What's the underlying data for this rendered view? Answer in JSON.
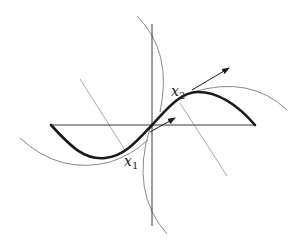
{
  "diagram": {
    "labels": {
      "x1": {
        "base": "x",
        "sub": "1"
      },
      "x2": {
        "base": "x",
        "sub": "2"
      }
    },
    "colors": {
      "curve": "#1a1a1a",
      "axes": "#3a3a3a",
      "circles": "#8a8a8a",
      "normals": "#a0a0a0",
      "arrows": "#1a1a1a",
      "background": "#ffffff"
    }
  }
}
